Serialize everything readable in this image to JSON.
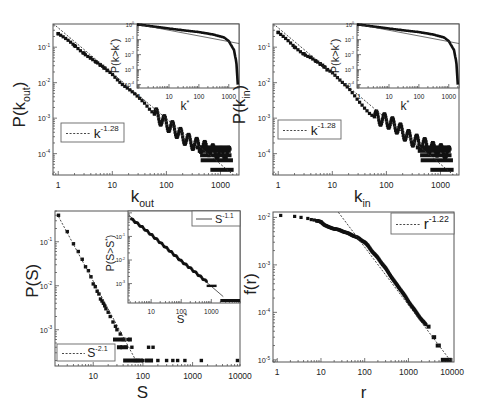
{
  "chart_data": [
    {
      "id": "a",
      "type": "scatter",
      "xscale": "log",
      "yscale": "log",
      "xlabel": "k_out",
      "ylabel": "P(k_out)",
      "xlim": [
        0.8,
        2200
      ],
      "ylim": [
        2.5e-05,
        0.45
      ],
      "xticks": [
        "1",
        "10",
        "100",
        "1000"
      ],
      "yticks": [
        "10^-1",
        "10^-2",
        "10^-3",
        "10^-4"
      ],
      "legend": {
        "label": "k^-1.28",
        "base": "k",
        "exp": "-1.28",
        "style": "dotted"
      },
      "fit": {
        "exponent": -1.28,
        "x": [
          0.8,
          1800
        ],
        "y0": 0.35
      },
      "series": [
        {
          "name": "P(k_out)",
          "x": [
            1,
            2,
            3,
            4,
            5,
            6,
            7,
            8,
            10,
            12,
            15,
            20,
            25,
            30,
            40,
            50,
            70,
            100,
            150,
            200,
            300,
            500,
            700,
            1000,
            1500
          ],
          "y": [
            0.24,
            0.11,
            0.068,
            0.05,
            0.038,
            0.031,
            0.026,
            0.022,
            0.017,
            0.013,
            0.0095,
            0.0068,
            0.005,
            0.0038,
            0.0025,
            0.0017,
            0.0011,
            0.0007,
            0.00045,
            0.0003,
            0.0002,
            0.00015,
            0.00012,
            0.0001,
            0.0001
          ]
        }
      ],
      "inset": {
        "xlabel": "k*",
        "ylabel": "P(k>k*)",
        "xticks": [
          "1",
          "10",
          "100",
          "1000"
        ],
        "yticks": [
          "10^0",
          "10^-1",
          "10^-2",
          "10^-3",
          "10^-4"
        ],
        "series": [
          {
            "name": "CCDF",
            "x": [
              1,
              3,
              10,
              30,
              100,
              300,
              700,
              1000,
              1500,
              1800,
              1900,
              2000
            ],
            "y": [
              1,
              0.75,
              0.55,
              0.42,
              0.32,
              0.22,
              0.14,
              0.08,
              0.02,
              0.003,
              0.0006,
              0.0001
            ]
          }
        ]
      }
    },
    {
      "id": "b",
      "type": "scatter",
      "xscale": "log",
      "yscale": "log",
      "xlabel": "k_in",
      "ylabel": "P(k_in)",
      "xlim": [
        0.8,
        2200
      ],
      "ylim": [
        2.5e-05,
        0.45
      ],
      "xticks": [
        "1",
        "10",
        "100",
        "1000"
      ],
      "yticks": [
        "10^-1",
        "10^-2",
        "10^-3",
        "10^-4"
      ],
      "legend": {
        "label": "k^-1.28",
        "base": "k",
        "exp": "-1.28",
        "style": "dotted"
      },
      "fit": {
        "exponent": -1.28,
        "x": [
          0.8,
          1800
        ],
        "y0": 0.35
      },
      "series": [
        {
          "name": "P(k_in)",
          "x": [
            1,
            2,
            3,
            4,
            5,
            6,
            7,
            8,
            10,
            12,
            15,
            20,
            25,
            30,
            40,
            50,
            70,
            100,
            150,
            200,
            300,
            500,
            700,
            1000,
            1500
          ],
          "y": [
            0.26,
            0.1,
            0.065,
            0.052,
            0.04,
            0.033,
            0.028,
            0.023,
            0.019,
            0.015,
            0.011,
            0.0072,
            0.0045,
            0.003,
            0.0018,
            0.0013,
            0.001,
            0.00085,
            0.0006,
            0.0004,
            0.00025,
            0.00018,
            0.00014,
            0.00012,
            0.0001
          ]
        }
      ],
      "inset": {
        "xlabel": "k*",
        "ylabel": "P(k>k*)",
        "xticks": [
          "1",
          "10",
          "100",
          "1000"
        ],
        "yticks": [
          "10^0",
          "10^-1",
          "10^-2",
          "10^-3",
          "10^-4"
        ],
        "series": [
          {
            "name": "CCDF",
            "x": [
              1,
              3,
              10,
              30,
              100,
              300,
              700,
              1000,
              1500,
              1800,
              1900,
              2000
            ],
            "y": [
              1,
              0.75,
              0.55,
              0.42,
              0.32,
              0.22,
              0.14,
              0.08,
              0.02,
              0.003,
              0.0006,
              0.0001
            ]
          }
        ]
      }
    },
    {
      "id": "c",
      "type": "scatter",
      "xscale": "log",
      "yscale": "log",
      "xlabel": "S",
      "ylabel": "P(S)",
      "xlim": [
        1.7,
        9000
      ],
      "ylim": [
        0.00015,
        0.5
      ],
      "xticks": [
        "10",
        "100",
        "1000",
        "10000"
      ],
      "yticks": [
        "10^-1",
        "10^-2",
        "10^-3"
      ],
      "legend": {
        "label": "S^-2.1",
        "base": "S",
        "exp": "-2.1",
        "style": "dotted"
      },
      "fit": {
        "exponent": -2.1,
        "x": [
          2,
          70
        ],
        "y0": 1.6
      },
      "series": [
        {
          "name": "P(S)",
          "x": [
            2,
            3,
            4,
            5,
            6,
            7,
            8,
            9,
            10,
            11,
            12,
            13,
            14,
            15,
            16,
            17,
            18,
            20,
            22,
            25,
            28,
            30,
            35,
            40,
            45,
            50,
            60,
            70,
            80,
            100,
            130,
            160,
            200,
            300,
            400,
            500,
            700,
            1500,
            8000
          ],
          "y": [
            0.4,
            0.17,
            0.09,
            0.06,
            0.04,
            0.027,
            0.022,
            0.016,
            0.011,
            0.0095,
            0.0075,
            0.0065,
            0.005,
            0.0045,
            0.004,
            0.0035,
            0.003,
            0.0025,
            0.002,
            0.0015,
            0.0012,
            0.001,
            0.0008,
            0.0006,
            0.0004,
            0.0006,
            0.0004,
            0.0002,
            0.0002,
            0.0002,
            0.0004,
            0.0004,
            0.0002,
            0.0002,
            0.0002,
            0.0002,
            0.0002,
            0.0002,
            0.0002
          ]
        }
      ],
      "inset": {
        "xlabel": "S*",
        "ylabel": "P(S>S*)",
        "xticks": [
          "10",
          "100",
          "1000"
        ],
        "yticks": [
          "10^-1",
          "10^-2",
          "10^-3"
        ],
        "legend": {
          "label": "S^-1.1",
          "base": "S",
          "exp": "-1.1",
          "style": "solid"
        },
        "series": [
          {
            "name": "CCDF",
            "x": [
              2,
              5,
              10,
              20,
              50,
              100,
              200,
              500,
              700,
              1000,
              1500,
              2000,
              8000
            ],
            "y": [
              0.6,
              0.25,
              0.12,
              0.055,
              0.02,
              0.009,
              0.0045,
              0.0017,
              0.0012,
              0.0008,
              0.0008,
              0.0003,
              0.0003
            ]
          }
        ]
      }
    },
    {
      "id": "d",
      "type": "scatter",
      "xscale": "log",
      "yscale": "log",
      "xlabel": "r",
      "ylabel": "f(r)",
      "xlim": [
        0.8,
        11000
      ],
      "ylim": [
        9e-06,
        0.013
      ],
      "xticks": [
        "1",
        "10",
        "100",
        "1000",
        "10000"
      ],
      "yticks": [
        "10^-2",
        "10^-3",
        "10^-4",
        "10^-5"
      ],
      "legend": {
        "label": "r^-1.22",
        "base": "r",
        "exp": "-1.22",
        "style": "dotted"
      },
      "fit": {
        "exponent": -1.22,
        "x": [
          25,
          10000
        ],
        "y0": 0.65
      },
      "series": [
        {
          "name": "f(r)",
          "x": [
            1.2,
            2.5,
            3.5,
            5,
            6,
            7,
            8,
            10,
            12,
            15,
            20,
            30,
            50,
            70,
            100,
            120,
            150,
            200,
            300,
            500,
            700,
            1000,
            1500,
            2000,
            3000,
            5000,
            7000,
            10000
          ],
          "y": [
            0.011,
            0.0105,
            0.01,
            0.0095,
            0.009,
            0.0088,
            0.0085,
            0.008,
            0.007,
            0.0062,
            0.0058,
            0.0052,
            0.0043,
            0.0037,
            0.003,
            0.0025,
            0.0019,
            0.0014,
            0.00085,
            0.00042,
            0.00028,
            0.00017,
            0.0001,
            7e-05,
            4.5e-05,
            2e-05,
            1e-05,
            1e-05
          ]
        }
      ]
    }
  ]
}
